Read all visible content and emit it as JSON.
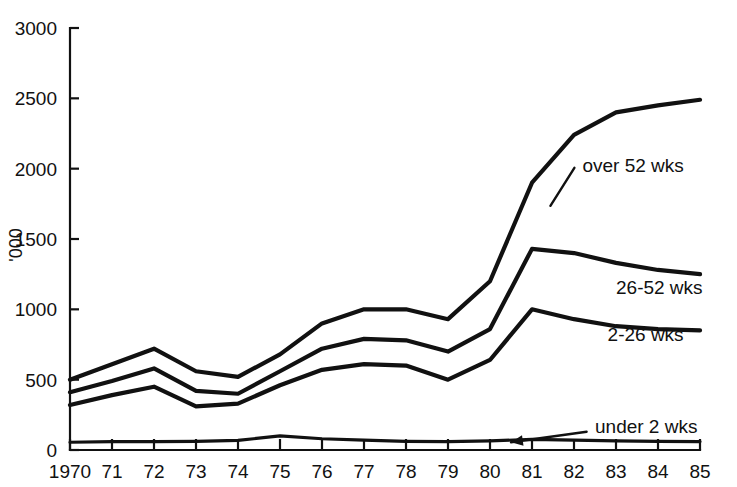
{
  "chart_data": {
    "type": "line",
    "title": "",
    "subtitle": "",
    "xlabel": "",
    "ylabel": "'000",
    "x": [
      1970,
      1971,
      1972,
      1973,
      1974,
      1975,
      1976,
      1977,
      1978,
      1979,
      1980,
      1981,
      1982,
      1983,
      1984,
      1985
    ],
    "xtick_labels": [
      "1970",
      "71",
      "72",
      "73",
      "74",
      "75",
      "76",
      "77",
      "78",
      "79",
      "80",
      "81",
      "82",
      "83",
      "84",
      "85"
    ],
    "ytick_labels": [
      "0",
      "500",
      "1000",
      "1500",
      "2000",
      "2500",
      "3000"
    ],
    "ytick_values": [
      0,
      500,
      1000,
      1500,
      2000,
      2500,
      3000
    ],
    "xlim": [
      1970,
      1985
    ],
    "ylim": [
      0,
      3000
    ],
    "grid": false,
    "legend_position": "inline-annotations",
    "series": [
      {
        "name": "over 52 wks",
        "label": "over 52 wks",
        "label_x": 1982.2,
        "label_y": 2020,
        "values": [
          500,
          610,
          720,
          560,
          520,
          680,
          900,
          1000,
          1000,
          930,
          1200,
          1900,
          2240,
          2400,
          2450,
          2490
        ]
      },
      {
        "name": "26-52 wks",
        "label": "26-52 wks",
        "label_x": 1983.0,
        "label_y": 1150,
        "values": [
          410,
          490,
          580,
          420,
          400,
          560,
          720,
          790,
          780,
          700,
          860,
          1430,
          1400,
          1330,
          1280,
          1250
        ]
      },
      {
        "name": "2-26 wks",
        "label": "2-26 wks",
        "label_x": 1982.8,
        "label_y": 820,
        "values": [
          320,
          390,
          450,
          310,
          330,
          460,
          570,
          610,
          600,
          500,
          640,
          1000,
          930,
          880,
          860,
          850
        ]
      },
      {
        "name": "under 2 wks",
        "label": "under 2 wks",
        "label_x": 1982.5,
        "label_y": 160,
        "values": [
          55,
          60,
          60,
          62,
          68,
          100,
          80,
          70,
          62,
          60,
          65,
          75,
          70,
          65,
          62,
          60
        ],
        "annotation_arrow": {
          "from_x": 1982.3,
          "from_y": 130,
          "to_x": 1980.5,
          "to_y": 55
        }
      }
    ]
  },
  "colors": {
    "line": "#111111",
    "axis": "#111111",
    "background": "#ffffff"
  }
}
